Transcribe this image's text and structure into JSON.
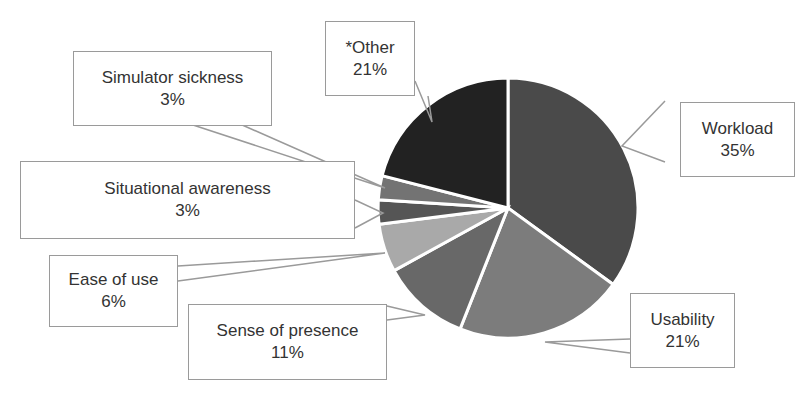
{
  "chart_data": {
    "type": "pie",
    "title": "",
    "slices": [
      {
        "label": "Workload",
        "value": 35,
        "display": "35%",
        "color": "#4a4a4a"
      },
      {
        "label": "Usability",
        "value": 21,
        "display": "21%",
        "color": "#7c7c7c"
      },
      {
        "label": "Sense of presence",
        "value": 11,
        "display": "11%",
        "color": "#686868"
      },
      {
        "label": "Ease of use",
        "value": 6,
        "display": "6%",
        "color": "#a9a9a9"
      },
      {
        "label": "Situational awareness",
        "value": 3,
        "display": "3%",
        "color": "#555555"
      },
      {
        "label": "Simulator sickness",
        "value": 3,
        "display": "3%",
        "color": "#737373"
      },
      {
        "label": "*Other",
        "value": 21,
        "display": "21%",
        "color": "#222222"
      }
    ],
    "start_angle_deg": 0,
    "direction": "clockwise",
    "legend": "data-callouts",
    "slice_separator_color": "#ffffff"
  },
  "labels": {
    "workload": {
      "name": "Workload",
      "pct": "35%"
    },
    "usability": {
      "name": "Usability",
      "pct": "21%"
    },
    "presence": {
      "name": "Sense of presence",
      "pct": "11%"
    },
    "ease": {
      "name": "Ease of use",
      "pct": "6%"
    },
    "situational": {
      "name": "Situational awareness",
      "pct": "3%"
    },
    "sickness": {
      "name": "Simulator sickness",
      "pct": "3%"
    },
    "other": {
      "name": "*Other",
      "pct": "21%"
    }
  }
}
